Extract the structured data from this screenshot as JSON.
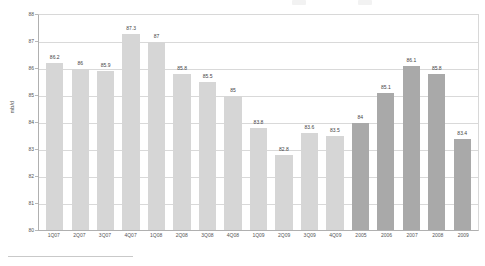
{
  "chart_data": {
    "type": "bar",
    "title": "",
    "xlabel": "",
    "ylabel": "mb/d",
    "ylim": [
      80,
      88
    ],
    "ystep": 1,
    "yticks": [
      "88",
      "87",
      "86",
      "85",
      "84",
      "83",
      "82",
      "81",
      "80"
    ],
    "grid": true,
    "legend": "none",
    "categories": [
      "1Q07",
      "2Q07",
      "3Q07",
      "4Q07",
      "1Q08",
      "2Q08",
      "3Q08",
      "4Q08",
      "1Q09",
      "2Q09",
      "3Q09",
      "4Q09",
      "2005",
      "2006",
      "2007",
      "2008",
      "2009"
    ],
    "values": [
      86.2,
      86,
      85.9,
      87.3,
      87,
      85.8,
      85.5,
      85,
      83.8,
      82.8,
      83.6,
      83.5,
      84,
      85.1,
      86.1,
      85.8,
      83.4
    ],
    "value_labels": [
      "86.2",
      "86",
      "85.9",
      "87.3",
      "87",
      "85.8",
      "85.5",
      "85",
      "83.8",
      "82.8",
      "83.6",
      "83.5",
      "84",
      "85.1",
      "86.1",
      "85.8",
      "83.4"
    ],
    "series_groups": [
      "quarterly",
      "quarterly",
      "quarterly",
      "quarterly",
      "quarterly",
      "quarterly",
      "quarterly",
      "quarterly",
      "quarterly",
      "quarterly",
      "quarterly",
      "quarterly",
      "annual",
      "annual",
      "annual",
      "annual",
      "annual"
    ],
    "colors": {
      "quarterly_bar": "#d6d6d6",
      "annual_bar": "#a9a9a9",
      "gridline": "#d9d9d9",
      "axis": "#b0b0b0",
      "text": "#555555"
    }
  }
}
